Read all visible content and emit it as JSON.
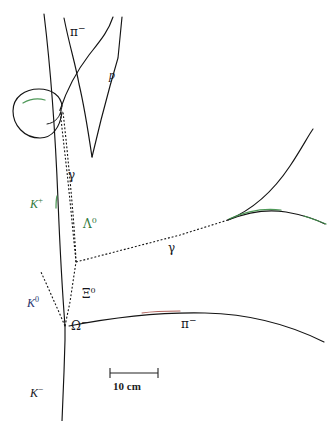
{
  "figure": {
    "background_color": "#ffffff",
    "width": 329,
    "height": 421
  },
  "scale_bar": {
    "caption": "10 cm",
    "x_start": 110,
    "x_end": 158,
    "y": 373
  },
  "labels": [
    {
      "id": "pi-minus-top",
      "text": "π",
      "sup": "",
      "sign": "−",
      "x": 70,
      "y": 26,
      "color": "#15151c",
      "greek": true,
      "name": "label-pi-minus-top"
    },
    {
      "id": "proton",
      "text": "p",
      "sup": "",
      "sign": "",
      "x": 109,
      "y": 69,
      "color": "#15151c",
      "greek": false,
      "name": "label-proton"
    },
    {
      "id": "gamma-left",
      "text": "γ",
      "sup": "",
      "sign": "",
      "x": 68,
      "y": 169,
      "color": "#15151c",
      "greek": true,
      "name": "label-gamma-left"
    },
    {
      "id": "k-plus",
      "text": "K",
      "sup": "",
      "sign": "+",
      "x": 30,
      "y": 198,
      "color": "#2f7a3c",
      "greek": false,
      "name": "label-k-plus"
    },
    {
      "id": "lambda-zero",
      "text": "Λ",
      "sup": "0",
      "sign": "",
      "x": 83,
      "y": 218,
      "color": "#2f7a3c",
      "greek": true,
      "name": "label-lambda-zero"
    },
    {
      "id": "gamma-right",
      "text": "γ",
      "sup": "",
      "sign": "",
      "x": 168,
      "y": 242,
      "color": "#15151c",
      "greek": true,
      "name": "label-gamma-right"
    },
    {
      "id": "k-zero",
      "text": "K",
      "sup": "0",
      "sign": "",
      "x": 27,
      "y": 297,
      "color": "#28356e",
      "greek": false,
      "name": "label-k-zero"
    },
    {
      "id": "xi-zero",
      "text": "Ξ",
      "sup": "0",
      "sign": "",
      "x": 82,
      "y": 288,
      "color": "#15151c",
      "greek": true,
      "name": "label-xi-zero"
    },
    {
      "id": "omega-minus",
      "text": "Ω",
      "sup": "",
      "sign": "−",
      "x": 71,
      "y": 320,
      "color": "#15151c",
      "greek": true,
      "name": "label-omega-minus"
    },
    {
      "id": "pi-minus-bottom",
      "text": "π",
      "sup": "",
      "sign": "−",
      "x": 181,
      "y": 318,
      "color": "#15151c",
      "greek": true,
      "name": "label-pi-minus-bottom"
    },
    {
      "id": "k-minus",
      "text": "K",
      "sup": "",
      "sign": "−",
      "x": 30,
      "y": 387,
      "color": "#15151c",
      "greek": false,
      "name": "label-k-minus"
    }
  ],
  "colors": {
    "track_black": "#141414",
    "track_green": "#3f8f4a",
    "track_red": "#9e3b33",
    "label_green": "#2f7a3c",
    "label_blue": "#28356e",
    "label_dark": "#15151c"
  },
  "tracks": {
    "k_minus_beam": {
      "name": "k-minus-incoming-beam",
      "style": "solid",
      "d": "M 62 421 L 64 372 L 65 340 L 65 326"
    },
    "k_plus_outgoing": {
      "name": "k-plus-outgoing-track",
      "style": "solid",
      "d": "M 65 326 C 63 300 60 250 58 200 C 56 150 52 80 44 14"
    },
    "xi_zero_dashed": {
      "name": "xi-zero-neutral-path",
      "style": "dashed",
      "d": "M 65 326 L 70 302 L 74 275 L 76 262"
    },
    "k_zero_dashed": {
      "name": "k-zero-neutral-path",
      "style": "dashed",
      "d": "M 65 326 L 58 310 L 50 292 L 41 272"
    },
    "lambda_zero_dashed": {
      "name": "lambda-zero-neutral-path",
      "style": "dashed",
      "d": "M 76 262 C 75 235 72 200 69 170 C 67 148 65 130 63 112"
    },
    "gamma_left_dashed": {
      "name": "gamma-left-photon-path",
      "style": "dashed",
      "d": "M 76 262 C 73 232 70 200 67 172 C 64 146 62 128 60 110"
    },
    "gamma_right_dashed": {
      "name": "gamma-right-photon-path",
      "style": "dashed",
      "d": "M 76 262 L 130 248 L 180 235 L 228 220"
    },
    "lambda_decay_proton": {
      "name": "proton-decay-track",
      "style": "solid",
      "d": "M 92 157 L 101 120 L 110 86 L 118 58 L 122 17"
    },
    "lambda_decay_pi": {
      "name": "pi-minus-decay-track",
      "style": "solid",
      "d": "M 92 157 C 88 130 84 105 79 84 C 75 62 70 48 64 18"
    },
    "pair_upper_arc": {
      "name": "electron-pair-upper-track",
      "style": "solid",
      "d": "M 60 110 C 66 92 76 72 89 55 C 100 41 108 32 113 17"
    },
    "pair_spiral": {
      "name": "electron-spiral-track",
      "style": "solid",
      "d": "M 62 112 C 60 128 52 138 40 138 C 24 138 13 125 13 111 C 13 97 25 89 39 89 C 52 89 61 96 62 106"
    },
    "pair_spiral_inner": {
      "name": "electron-spiral-inner-track",
      "style": "solid",
      "d": "M 62 106 C 61 117 55 123 47 124"
    },
    "pair_spiral_green": {
      "name": "electron-spiral-green-segment",
      "style": "green",
      "d": "M 23 103 C 30 99 38 98 45 100"
    },
    "gamma_conv_upper": {
      "name": "gamma-conversion-upper-track",
      "style": "solid",
      "d": "M 228 220 C 252 210 274 190 290 166 C 302 148 308 136 313 129"
    },
    "gamma_conv_lower": {
      "name": "gamma-conversion-lower-track",
      "style": "solid",
      "d": "M 228 220 C 248 212 268 209 286 212 C 303 215 315 219 325 224"
    },
    "gamma_conv_green": {
      "name": "gamma-conversion-green-segment",
      "style": "green",
      "d": "M 229 219 C 246 211 264 208 281 210"
    },
    "gamma_conv_green_tail": {
      "name": "gamma-conversion-green-tail",
      "style": "green",
      "d": "M 304 216 C 313 219 319 221 326 224"
    },
    "omega_pi_minus": {
      "name": "pi-minus-from-omega-track",
      "style": "solid",
      "d": "M 69 326 C 110 318 160 312 205 313 C 252 314 292 326 324 342"
    },
    "omega_pi_red_segment": {
      "name": "pi-minus-red-segment",
      "style": "red",
      "d": "M 142 313 C 155 311 168 311 180 311"
    },
    "k_plus_green_hint": {
      "name": "k-plus-green-segment",
      "style": "green",
      "d": "M 57 196 C 56 200 56 204 56 208"
    }
  }
}
